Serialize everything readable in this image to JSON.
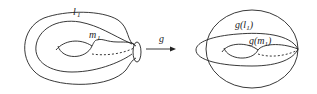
{
  "figure": {
    "left": {
      "label_l": "l",
      "label_l_sub": "1",
      "label_m": "m",
      "label_m_sub": "1"
    },
    "arrow": {
      "label": "g"
    },
    "right": {
      "label_gl_prefix": "g(",
      "label_gl_var": "l",
      "label_gl_sub": "1",
      "label_gl_suffix": ")",
      "label_gm_prefix": "g(",
      "label_gm_var": "m",
      "label_gm_sub": "1",
      "label_gm_suffix": ")"
    }
  },
  "colors": {
    "stroke": "#222222",
    "background": "#ffffff"
  }
}
